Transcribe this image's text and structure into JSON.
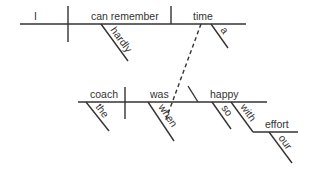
{
  "diagram": {
    "type": "sentence-diagram",
    "sentence": "I can hardly remember a time when the coach was so happy with our effort.",
    "main_clause": {
      "subject": "I",
      "verb": "can remember",
      "verb_modifier": "hardly",
      "object": "time",
      "object_modifier": "a"
    },
    "subordinate_clause": {
      "connector": "when",
      "subject": "coach",
      "subject_modifier": "the",
      "verb": "was",
      "predicate_adjective": "happy",
      "adjective_modifier": "so",
      "preposition": "with",
      "prep_object": "effort",
      "prep_object_modifier": "our"
    },
    "line_color": "#333333"
  }
}
